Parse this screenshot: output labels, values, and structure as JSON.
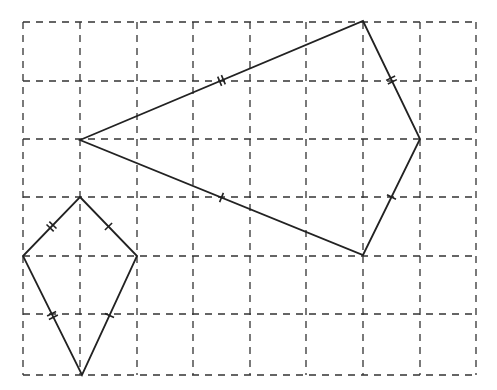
{
  "diagram": {
    "type": "grid-with-kites",
    "grid": {
      "columns": 8,
      "rows": 6,
      "x_lines": [
        23,
        80,
        137,
        193,
        250,
        306,
        363,
        420,
        476
      ],
      "y_lines": [
        22,
        81,
        139,
        197,
        256,
        314,
        375
      ],
      "line_style": "dashed",
      "color": "#333333"
    },
    "shapes": [
      {
        "name": "large-kite",
        "vertices": [
          [
            80,
            140
          ],
          [
            363,
            21
          ],
          [
            420,
            139
          ],
          [
            363,
            255
          ]
        ],
        "color": "#222222",
        "tick_marks": [
          {
            "side": "left-top",
            "count": 2
          },
          {
            "side": "left-bottom",
            "count": 2
          },
          {
            "side": "top-right",
            "count": 1
          },
          {
            "side": "right-bottom",
            "count": 1
          }
        ]
      },
      {
        "name": "small-kite",
        "vertices": [
          [
            80,
            197
          ],
          [
            137,
            256
          ],
          [
            82,
            375
          ],
          [
            23,
            256
          ]
        ],
        "color": "#222222",
        "tick_marks": [
          {
            "side": "top-right",
            "count": 1
          },
          {
            "side": "top-left",
            "count": 1
          },
          {
            "side": "right-bottom",
            "count": 2
          },
          {
            "side": "left-bottom",
            "count": 2
          }
        ]
      }
    ]
  }
}
